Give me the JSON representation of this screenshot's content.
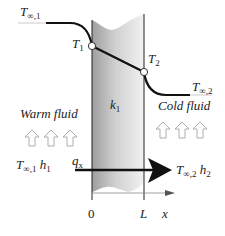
{
  "diagram": {
    "labels": {
      "t_inf_1": {
        "main": "T",
        "sub": "∞,1"
      },
      "t1": {
        "main": "T",
        "sub": "1"
      },
      "t2": {
        "main": "T",
        "sub": "2"
      },
      "t_inf_2": {
        "main": "T",
        "sub": "∞,2"
      },
      "k1": {
        "main": "k",
        "sub": "1"
      },
      "warm_fluid": "Warm fluid",
      "cold_fluid": "Cold fluid",
      "left_conditions": {
        "t": "T",
        "t_sub": "∞,1",
        "h": "h",
        "h_sub": "1"
      },
      "right_conditions": {
        "t": "T",
        "t_sub": "∞,2",
        "h": "h",
        "h_sub": "2"
      },
      "heat_flux": {
        "main": "q",
        "sub": "x"
      },
      "x_origin": "0",
      "x_length": "L",
      "x_axis": "x"
    },
    "colors": {
      "wall_light": "#e6e6e6",
      "wall_dark": "#9a9a9a",
      "line": "#111111",
      "arrow_outline": "#999999"
    },
    "nodes": [
      {
        "id": "T1",
        "x": 0,
        "label": "T1"
      },
      {
        "id": "T2",
        "x": "L",
        "label": "T2"
      }
    ]
  }
}
